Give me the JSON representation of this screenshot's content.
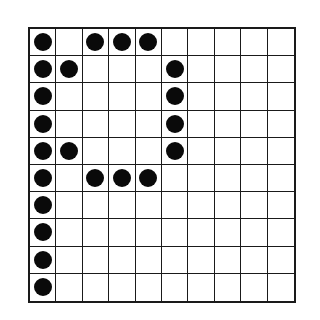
{
  "diagram": {
    "type": "dot-grid",
    "rows": 10,
    "cols": 10,
    "colors": {
      "grid_line": "#1a1a1a",
      "dot": "#0a0a0a",
      "background": "#ffffff"
    },
    "filled_cells": [
      [
        0,
        0
      ],
      [
        0,
        2
      ],
      [
        0,
        3
      ],
      [
        0,
        4
      ],
      [
        1,
        0
      ],
      [
        1,
        1
      ],
      [
        1,
        5
      ],
      [
        2,
        0
      ],
      [
        2,
        5
      ],
      [
        3,
        0
      ],
      [
        3,
        5
      ],
      [
        4,
        0
      ],
      [
        4,
        1
      ],
      [
        4,
        5
      ],
      [
        5,
        0
      ],
      [
        5,
        2
      ],
      [
        5,
        3
      ],
      [
        5,
        4
      ],
      [
        6,
        0
      ],
      [
        7,
        0
      ],
      [
        8,
        0
      ],
      [
        9,
        0
      ]
    ],
    "matrix": [
      [
        1,
        0,
        1,
        1,
        1,
        0,
        0,
        0,
        0,
        0
      ],
      [
        1,
        1,
        0,
        0,
        0,
        1,
        0,
        0,
        0,
        0
      ],
      [
        1,
        0,
        0,
        0,
        0,
        1,
        0,
        0,
        0,
        0
      ],
      [
        1,
        0,
        0,
        0,
        0,
        1,
        0,
        0,
        0,
        0
      ],
      [
        1,
        1,
        0,
        0,
        0,
        1,
        0,
        0,
        0,
        0
      ],
      [
        1,
        0,
        1,
        1,
        1,
        0,
        0,
        0,
        0,
        0
      ],
      [
        1,
        0,
        0,
        0,
        0,
        0,
        0,
        0,
        0,
        0
      ],
      [
        1,
        0,
        0,
        0,
        0,
        0,
        0,
        0,
        0,
        0
      ],
      [
        1,
        0,
        0,
        0,
        0,
        0,
        0,
        0,
        0,
        0
      ],
      [
        1,
        0,
        0,
        0,
        0,
        0,
        0,
        0,
        0,
        0
      ]
    ]
  }
}
